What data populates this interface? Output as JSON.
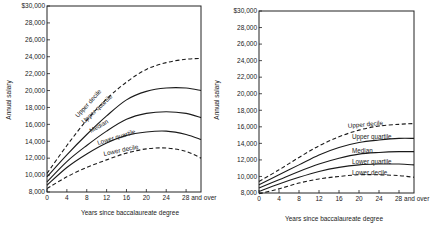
{
  "chart_data": [
    {
      "type": "line",
      "title": "",
      "xlabel": "Years since baccalaureate degree",
      "ylabel": "Annual salary",
      "x": [
        0,
        4,
        8,
        12,
        16,
        20,
        24,
        28,
        31
      ],
      "x_tick_labels": [
        "0",
        "4",
        "8",
        "12",
        "16",
        "20",
        "24",
        "28 and over"
      ],
      "y_tick_labels": [
        "8,000",
        "10,000",
        "12,000",
        "14,000",
        "16,000",
        "18,000",
        "20,000",
        "22,000",
        "24,000",
        "26,000",
        "28,000",
        "$30,000"
      ],
      "ylim": [
        8000,
        30000
      ],
      "xlim": [
        0,
        31
      ],
      "grid": false,
      "legend": "inline labels on curves",
      "series": [
        {
          "name": "Upper decile",
          "style": "dashed",
          "values": [
            10200,
            13500,
            16500,
            19000,
            21000,
            22500,
            23300,
            23700,
            23800
          ]
        },
        {
          "name": "Upper quartile",
          "style": "solid",
          "values": [
            9800,
            12400,
            14800,
            17000,
            18900,
            19900,
            20300,
            20300,
            20000
          ]
        },
        {
          "name": "Median",
          "style": "solid",
          "values": [
            9200,
            11600,
            13500,
            15200,
            16600,
            17300,
            17500,
            17300,
            16800
          ]
        },
        {
          "name": "Lower quartile",
          "style": "solid",
          "values": [
            8800,
            10900,
            12500,
            13800,
            14700,
            15100,
            15200,
            14800,
            14200
          ]
        },
        {
          "name": "Lower decile",
          "style": "dashed",
          "values": [
            8400,
            9800,
            10900,
            11800,
            12600,
            13100,
            13200,
            12800,
            12000
          ]
        }
      ]
    },
    {
      "type": "line",
      "title": "",
      "xlabel": "Years since baccalaureate degree",
      "ylabel": "Annual salary",
      "x": [
        0,
        4,
        8,
        12,
        16,
        20,
        24,
        28,
        31
      ],
      "x_tick_labels": [
        "0",
        "4",
        "8",
        "12",
        "16",
        "20",
        "24",
        "28 and over"
      ],
      "y_tick_labels": [
        "8,000",
        "10,000",
        "12,000",
        "14,000",
        "16,000",
        "18,000",
        "20,000",
        "22,000",
        "24,000",
        "26,000",
        "28,000",
        "$30,000"
      ],
      "ylim": [
        8000,
        30000
      ],
      "xlim": [
        0,
        31
      ],
      "grid": false,
      "legend": "inline labels above curves",
      "series": [
        {
          "name": "Upper decile",
          "style": "dashed",
          "values": [
            9400,
            10800,
            12300,
            13700,
            14800,
            15600,
            16100,
            16300,
            16400
          ]
        },
        {
          "name": "Upper quartile",
          "style": "solid",
          "values": [
            9000,
            10200,
            11400,
            12600,
            13500,
            14100,
            14400,
            14600,
            14600
          ]
        },
        {
          "name": "Median",
          "style": "solid",
          "values": [
            8600,
            9600,
            10600,
            11500,
            12200,
            12700,
            12900,
            13000,
            13000
          ]
        },
        {
          "name": "Lower quartile",
          "style": "solid",
          "values": [
            8200,
            9100,
            9900,
            10600,
            11100,
            11400,
            11500,
            11500,
            11400
          ]
        },
        {
          "name": "Lower decile",
          "style": "dashed",
          "values": [
            7900,
            8500,
            9200,
            9700,
            10000,
            10200,
            10200,
            10100,
            9900
          ]
        }
      ]
    }
  ],
  "left_chart": {
    "ylabel": "Annual salary",
    "xlabel": "Years since baccalaureate degree",
    "curve_labels": {
      "upper_decile": "Upper decile",
      "upper_quartile": "Upper quartile",
      "median": "Median",
      "lower_quartile": "Lower quartile",
      "lower_decile": "Lower decile"
    }
  },
  "right_chart": {
    "ylabel": "Annual salary",
    "xlabel": "Years since baccalaureate degree",
    "curve_labels": {
      "upper_decile": "Upper decile",
      "upper_quartile": "Upper quartile",
      "median": "Median",
      "lower_quartile": "Lower quartile",
      "lower_decile": "Lower decile"
    }
  }
}
